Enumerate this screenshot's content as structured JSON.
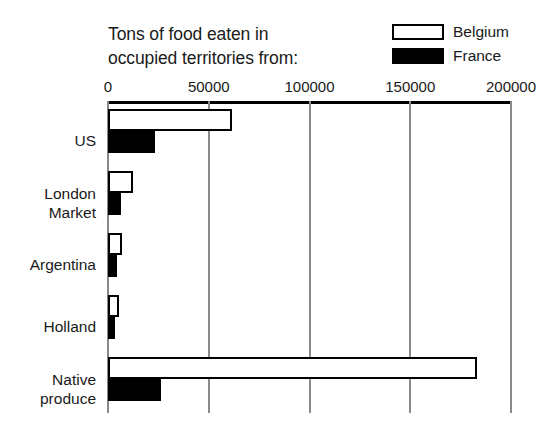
{
  "chart_data": {
    "type": "bar",
    "orientation": "horizontal",
    "title": "Tons of food eaten in occupied territories from:",
    "title_lines": [
      "Tons of food eaten in",
      "occupied territories from:"
    ],
    "xlabel": "",
    "ylabel": "",
    "xlim": [
      0,
      200000
    ],
    "xticks": [
      0,
      50000,
      100000,
      150000,
      200000
    ],
    "xtick_labels": [
      "0",
      "50000",
      "100000",
      "150000",
      "200000"
    ],
    "grid": true,
    "legend_position": "top-right",
    "categories": [
      "US",
      "London Market",
      "Argentina",
      "Holland",
      "Native produce"
    ],
    "category_label_lines": [
      [
        "US"
      ],
      [
        "London",
        "Market"
      ],
      [
        "Argentina"
      ],
      [
        "Holland"
      ],
      [
        "Native",
        "produce"
      ]
    ],
    "series": [
      {
        "name": "Belgium",
        "color": "#ffffff",
        "edge_color": "#000000",
        "values": [
          61500,
          12500,
          7000,
          5500,
          183000
        ]
      },
      {
        "name": "France",
        "color": "#000000",
        "edge_color": "#000000",
        "values": [
          23500,
          6500,
          4500,
          3500,
          26500
        ]
      }
    ]
  },
  "legend": {
    "items": [
      {
        "label": "Belgium",
        "swatch": "white-outlined-rectangle"
      },
      {
        "label": "France",
        "swatch": "black-filled-rectangle"
      }
    ]
  }
}
